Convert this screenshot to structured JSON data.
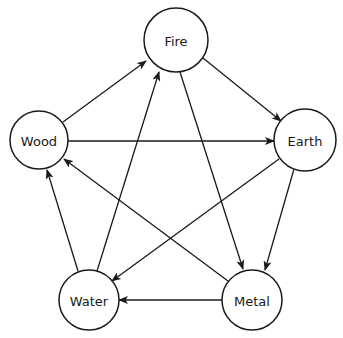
{
  "diagram": {
    "nodes": [
      {
        "id": "fire",
        "label": "Fire",
        "cx": 176,
        "cy": 40,
        "r": 32
      },
      {
        "id": "wood",
        "label": "Wood",
        "cx": 39,
        "cy": 140,
        "r": 29
      },
      {
        "id": "earth",
        "label": "Earth",
        "cx": 305,
        "cy": 140,
        "r": 31
      },
      {
        "id": "water",
        "label": "Water",
        "cx": 89,
        "cy": 300,
        "r": 30
      },
      {
        "id": "metal",
        "label": "Metal",
        "cx": 252,
        "cy": 300,
        "r": 30
      }
    ],
    "edges": [
      {
        "from": "Wood",
        "to": "Fire",
        "x1": 63,
        "y1": 122,
        "x2": 146,
        "y2": 61
      },
      {
        "from": "Fire",
        "to": "Earth",
        "x1": 203,
        "y1": 58,
        "x2": 281,
        "y2": 121
      },
      {
        "from": "Wood",
        "to": "Earth",
        "x1": 68,
        "y1": 141,
        "x2": 274,
        "y2": 141
      },
      {
        "from": "Fire",
        "to": "Metal",
        "x1": 180,
        "y1": 72,
        "x2": 243,
        "y2": 269
      },
      {
        "from": "Earth",
        "to": "Metal",
        "x1": 294,
        "y1": 169,
        "x2": 265,
        "y2": 270
      },
      {
        "from": "Earth",
        "to": "Water",
        "x1": 279,
        "y1": 159,
        "x2": 112,
        "y2": 281
      },
      {
        "from": "Metal",
        "to": "Water",
        "x1": 222,
        "y1": 300,
        "x2": 119,
        "y2": 300
      },
      {
        "from": "Water",
        "to": "Wood",
        "x1": 78,
        "y1": 271,
        "x2": 47,
        "y2": 170
      },
      {
        "from": "Water",
        "to": "Fire",
        "x1": 97,
        "y1": 271,
        "x2": 159,
        "y2": 72
      },
      {
        "from": "Metal",
        "to": "Wood",
        "x1": 228,
        "y1": 281,
        "x2": 64,
        "y2": 159
      }
    ],
    "colors": {
      "stroke": "#1a1a1a",
      "fill": "#ffffff",
      "background": "#ffffff"
    }
  }
}
